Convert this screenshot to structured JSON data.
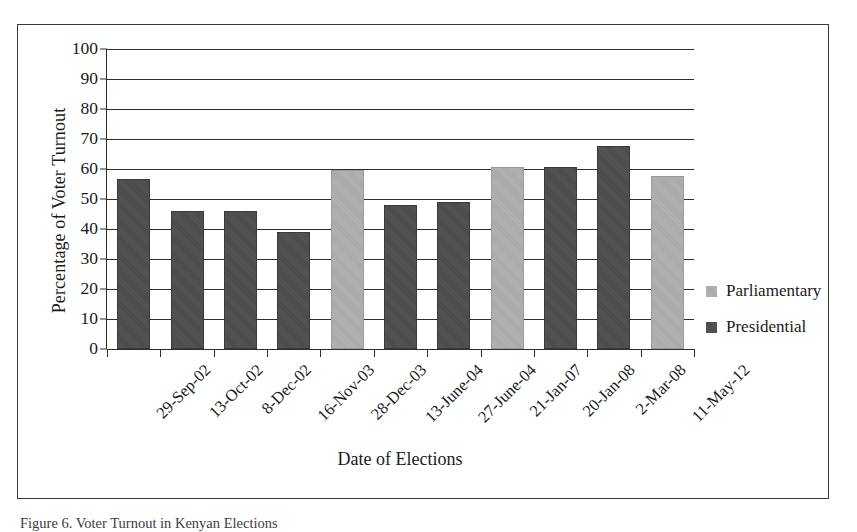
{
  "figure": {
    "caption": "Figure 6. Voter Turnout in Kenyan Elections"
  },
  "chart_data": {
    "type": "bar",
    "title": "",
    "xlabel": "Date of Elections",
    "ylabel": "Percentage of Voter Turnout",
    "ylim": [
      0,
      100
    ],
    "ytick_step": 10,
    "yticks": [
      "100",
      "90",
      "80",
      "70",
      "60",
      "50",
      "40",
      "30",
      "20",
      "10",
      "0"
    ],
    "grid": true,
    "legend_position": "right",
    "categories": [
      "29-Sep-02",
      "13-Oct-02",
      "8-Dec-02",
      "16-Nov-03",
      "28-Dec-03",
      "13-June-04",
      "27-June-04",
      "21-Jan-07",
      "20-Jan-08",
      "2-Mar-08",
      "11-May-12"
    ],
    "values": [
      56,
      45.5,
      45.5,
      38.5,
      59,
      47.5,
      48.5,
      60,
      60,
      67,
      57
    ],
    "bar_series": [
      "Presidential",
      "Presidential",
      "Presidential",
      "Presidential",
      "Parliamentary",
      "Presidential",
      "Presidential",
      "Parliamentary",
      "Presidential",
      "Presidential",
      "Parliamentary"
    ],
    "series": [
      {
        "name": "Parliamentary",
        "color": "#a8a8a8",
        "points": [
          {
            "category": "28-Dec-03",
            "value": 59
          },
          {
            "category": "21-Jan-07",
            "value": 60
          },
          {
            "category": "11-May-12",
            "value": 57
          }
        ]
      },
      {
        "name": "Presidential",
        "color": "#4a4a4a",
        "points": [
          {
            "category": "29-Sep-02",
            "value": 56
          },
          {
            "category": "13-Oct-02",
            "value": 45.5
          },
          {
            "category": "8-Dec-02",
            "value": 45.5
          },
          {
            "category": "16-Nov-03",
            "value": 38.5
          },
          {
            "category": "13-June-04",
            "value": 47.5
          },
          {
            "category": "27-June-04",
            "value": 48.5
          },
          {
            "category": "20-Jan-08",
            "value": 60
          },
          {
            "category": "2-Mar-08",
            "value": 67
          }
        ]
      }
    ]
  },
  "legend": {
    "items": [
      {
        "label": "Parliamentary",
        "key": "parliamentary"
      },
      {
        "label": "Presidential",
        "key": "presidential"
      }
    ]
  }
}
